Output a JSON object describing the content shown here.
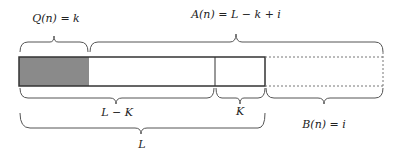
{
  "labels": {
    "q": "Q(n) = k",
    "a": "A(n) = L − k + i",
    "l_minus_k": "L − K",
    "k": "K",
    "b": "B(n) = i",
    "l": "L"
  },
  "colors": {
    "filled": "#8a8a8a",
    "stroke": "#333333",
    "dashed": "#777777",
    "brace": "#555555"
  },
  "segments": [
    {
      "name": "filled-k",
      "x0": 19,
      "x1": 89,
      "style": "gray"
    },
    {
      "name": "white-lk",
      "x0": 89,
      "x1": 215,
      "style": "solid"
    },
    {
      "name": "K-block",
      "x0": 215,
      "x1": 265,
      "style": "solid"
    },
    {
      "name": "B-block",
      "x0": 265,
      "x1": 383,
      "style": "dashed"
    }
  ]
}
